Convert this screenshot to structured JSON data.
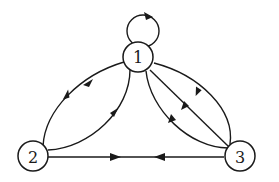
{
  "diagram": {
    "type": "directed-graph",
    "nodes": [
      {
        "id": "1",
        "label": "1"
      },
      {
        "id": "2",
        "label": "2"
      },
      {
        "id": "3",
        "label": "3"
      }
    ],
    "edges": [
      {
        "from": "1",
        "to": "1",
        "kind": "self-loop"
      },
      {
        "from": "1",
        "to": "2",
        "kind": "curved-inner"
      },
      {
        "from": "2",
        "to": "1",
        "kind": "curved-outer"
      },
      {
        "from": "2",
        "to": "3",
        "kind": "straight"
      },
      {
        "from": "3",
        "to": "2",
        "kind": "straight"
      },
      {
        "from": "3",
        "to": "1",
        "kind": "curved-outer"
      },
      {
        "from": "3",
        "to": "1",
        "kind": "straight"
      },
      {
        "from": "3",
        "to": "1",
        "kind": "curved-inner"
      }
    ],
    "colors": {
      "stroke": "#1a1a1a",
      "background": "#ffffff"
    }
  }
}
